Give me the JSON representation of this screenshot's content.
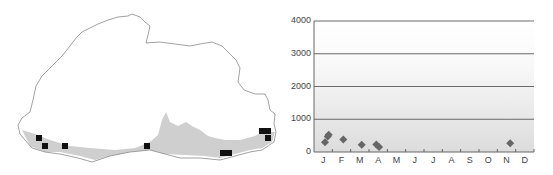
{
  "chart_data": {
    "type": "scatter",
    "title": "",
    "xlabel": "",
    "ylabel": "",
    "categories": [
      "J",
      "F",
      "M",
      "A",
      "M",
      "J",
      "J",
      "A",
      "S",
      "O",
      "N",
      "D"
    ],
    "y_ticks": [
      "0",
      "1000",
      "2000",
      "3000",
      "4000"
    ],
    "ylim": [
      0,
      4000
    ],
    "grid": true,
    "legend": "none",
    "background": "vertical gradient, white at top to light grey at bottom",
    "marker": "diamond",
    "marker_color": "#666666",
    "series": [
      {
        "name": "records",
        "points": [
          {
            "month": 1.1,
            "elevation": 300
          },
          {
            "month": 1.25,
            "elevation": 470
          },
          {
            "month": 1.3,
            "elevation": 530
          },
          {
            "month": 2.1,
            "elevation": 380
          },
          {
            "month": 3.1,
            "elevation": 220
          },
          {
            "month": 3.9,
            "elevation": 230
          },
          {
            "month": 4.05,
            "elevation": 150
          },
          {
            "month": 11.2,
            "elevation": 270
          }
        ]
      }
    ]
  },
  "map": {
    "description": "Outline map of Bhutan with grey southern lowland band and black square locality markers",
    "band_color": "#cccccc",
    "marker_color": "#111111",
    "outline_color": "#888888",
    "markers": [
      {
        "x": 39,
        "y": 138
      },
      {
        "x": 45,
        "y": 146
      },
      {
        "x": 65,
        "y": 146
      },
      {
        "x": 147,
        "y": 146
      },
      {
        "x": 223,
        "y": 153
      },
      {
        "x": 229,
        "y": 153
      },
      {
        "x": 262,
        "y": 131
      },
      {
        "x": 268,
        "y": 131
      },
      {
        "x": 268,
        "y": 138
      }
    ]
  }
}
